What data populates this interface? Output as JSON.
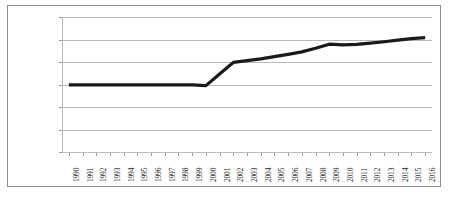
{
  "chart_data": {
    "type": "line",
    "title": "",
    "xlabel": "",
    "ylabel": "",
    "ylim": [
      0,
      60000
    ],
    "grid": true,
    "legend": "none",
    "y_ticks": [
      "$0",
      "$10,000",
      "$20,000",
      "$30,000",
      "$40,000",
      "$50,000",
      "$60,000"
    ],
    "y_tick_values": [
      0,
      10000,
      20000,
      30000,
      40000,
      50000,
      60000
    ],
    "categories": [
      "1990",
      "1991",
      "1992",
      "1993",
      "1994",
      "1995",
      "1996",
      "1997",
      "1998",
      "1999",
      "2000",
      "2001",
      "2002",
      "2003",
      "2004",
      "2005",
      "2006",
      "2007",
      "2008",
      "2009",
      "2010",
      "2011",
      "2012",
      "2013",
      "2014",
      "2015",
      "2016"
    ],
    "series": [
      {
        "name": "Value",
        "color": "#1a1a1a",
        "values": [
          29800,
          29800,
          29800,
          29800,
          29800,
          29800,
          29800,
          29800,
          29800,
          29800,
          29500,
          34700,
          39800,
          40600,
          41400,
          42400,
          43400,
          44500,
          46100,
          47900,
          47600,
          47800,
          48400,
          49000,
          49700,
          50400,
          50800
        ]
      }
    ]
  },
  "axes": {
    "y_labels": [
      "$60,000",
      "$50,000",
      "$40,000",
      "$30,000",
      "$20,000",
      "$10,000",
      "$0"
    ],
    "x_labels": [
      "1990",
      "1991",
      "1992",
      "1993",
      "1994",
      "1995",
      "1996",
      "1997",
      "1998",
      "1999",
      "2000",
      "2001",
      "2002",
      "2003",
      "2004",
      "2005",
      "2006",
      "2007",
      "2008",
      "2009",
      "2010",
      "2011",
      "2012",
      "2013",
      "2014",
      "2015",
      "2016"
    ]
  },
  "style": {
    "line_color": "#1a1a1a",
    "grid_color": "#b9b9b9",
    "border_color": "#8d8d8d",
    "text_color": "#262626",
    "background": "#ffffff"
  }
}
